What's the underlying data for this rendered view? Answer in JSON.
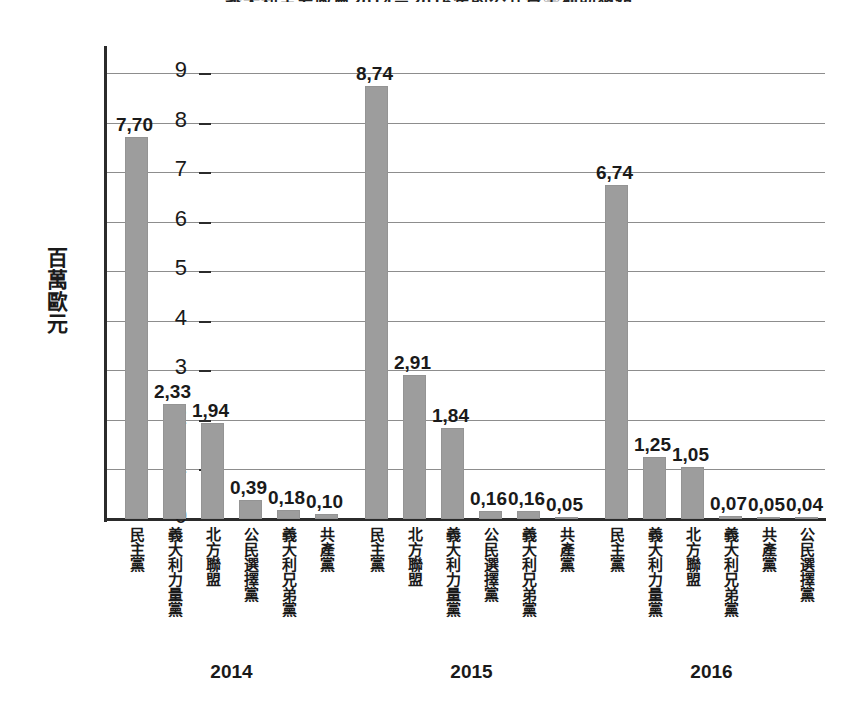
{
  "chart_data": {
    "type": "bar",
    "title": "義大利主要政黨2014－2016年的公共資金補助總額",
    "xlabel": "",
    "ylabel": "百萬歐元",
    "ylim": [
      0,
      9
    ],
    "yticks": [
      "0",
      "1",
      "2",
      "3",
      "4",
      "5",
      "6",
      "7",
      "8",
      "9"
    ],
    "grid": true,
    "legend": "none",
    "value_format": "comma-decimal",
    "bar_color": "#9d9d9d",
    "groups": [
      {
        "year": "2014",
        "categories": [
          "民主黨",
          "義大利力量黨",
          "北方聯盟",
          "公民選擇黨",
          "義大利兄弟黨",
          "共產黨"
        ],
        "values": [
          7.7,
          2.33,
          1.94,
          0.39,
          0.18,
          0.1
        ],
        "labels": [
          "7,70",
          "2,33",
          "1,94",
          "0,39",
          "0,18",
          "0,10"
        ]
      },
      {
        "year": "2015",
        "categories": [
          "民主黨",
          "北方聯盟",
          "義大利力量黨",
          "公民選擇黨",
          "義大利兄弟黨",
          "共產黨"
        ],
        "values": [
          8.74,
          2.91,
          1.84,
          0.16,
          0.16,
          0.05
        ],
        "labels": [
          "8,74",
          "2,91",
          "1,84",
          "0,16",
          "0,16",
          "0,05"
        ]
      },
      {
        "year": "2016",
        "categories": [
          "民主黨",
          "義大利力量黨",
          "北方聯盟",
          "義大利兄弟黨",
          "共產黨",
          "公民選擇黨"
        ],
        "values": [
          6.74,
          1.25,
          1.05,
          0.07,
          0.05,
          0.04
        ],
        "labels": [
          "6,74",
          "1,25",
          "1,05",
          "0,07",
          "0,05",
          "0,04"
        ]
      }
    ]
  }
}
